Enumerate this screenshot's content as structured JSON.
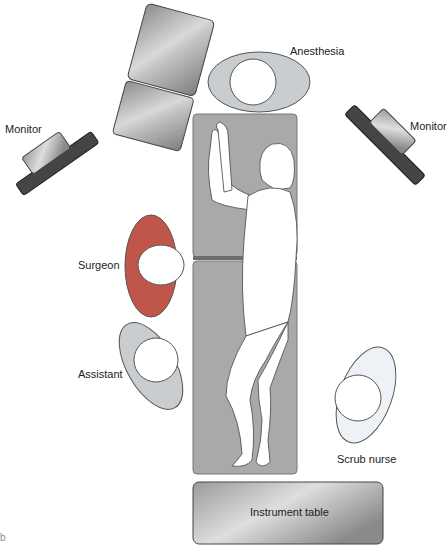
{
  "diagram": {
    "labels": {
      "anesthesia": "Anesthesia",
      "monitor_left": "Monitor",
      "monitor_right": "Monitor",
      "surgeon": "Surgeon",
      "assistant": "Assistant",
      "scrub_nurse": "Scrub nurse",
      "instrument_table": "Instrument table"
    },
    "colors": {
      "surgeon": "#c0564a",
      "staff": "#c9cdd0",
      "scrub_nurse": "#eef2f6",
      "or_table": "#a8a8a8",
      "monitor_base": "#4a4a4a",
      "equipment": "#b8b8b8"
    },
    "corner_mark": "b"
  }
}
